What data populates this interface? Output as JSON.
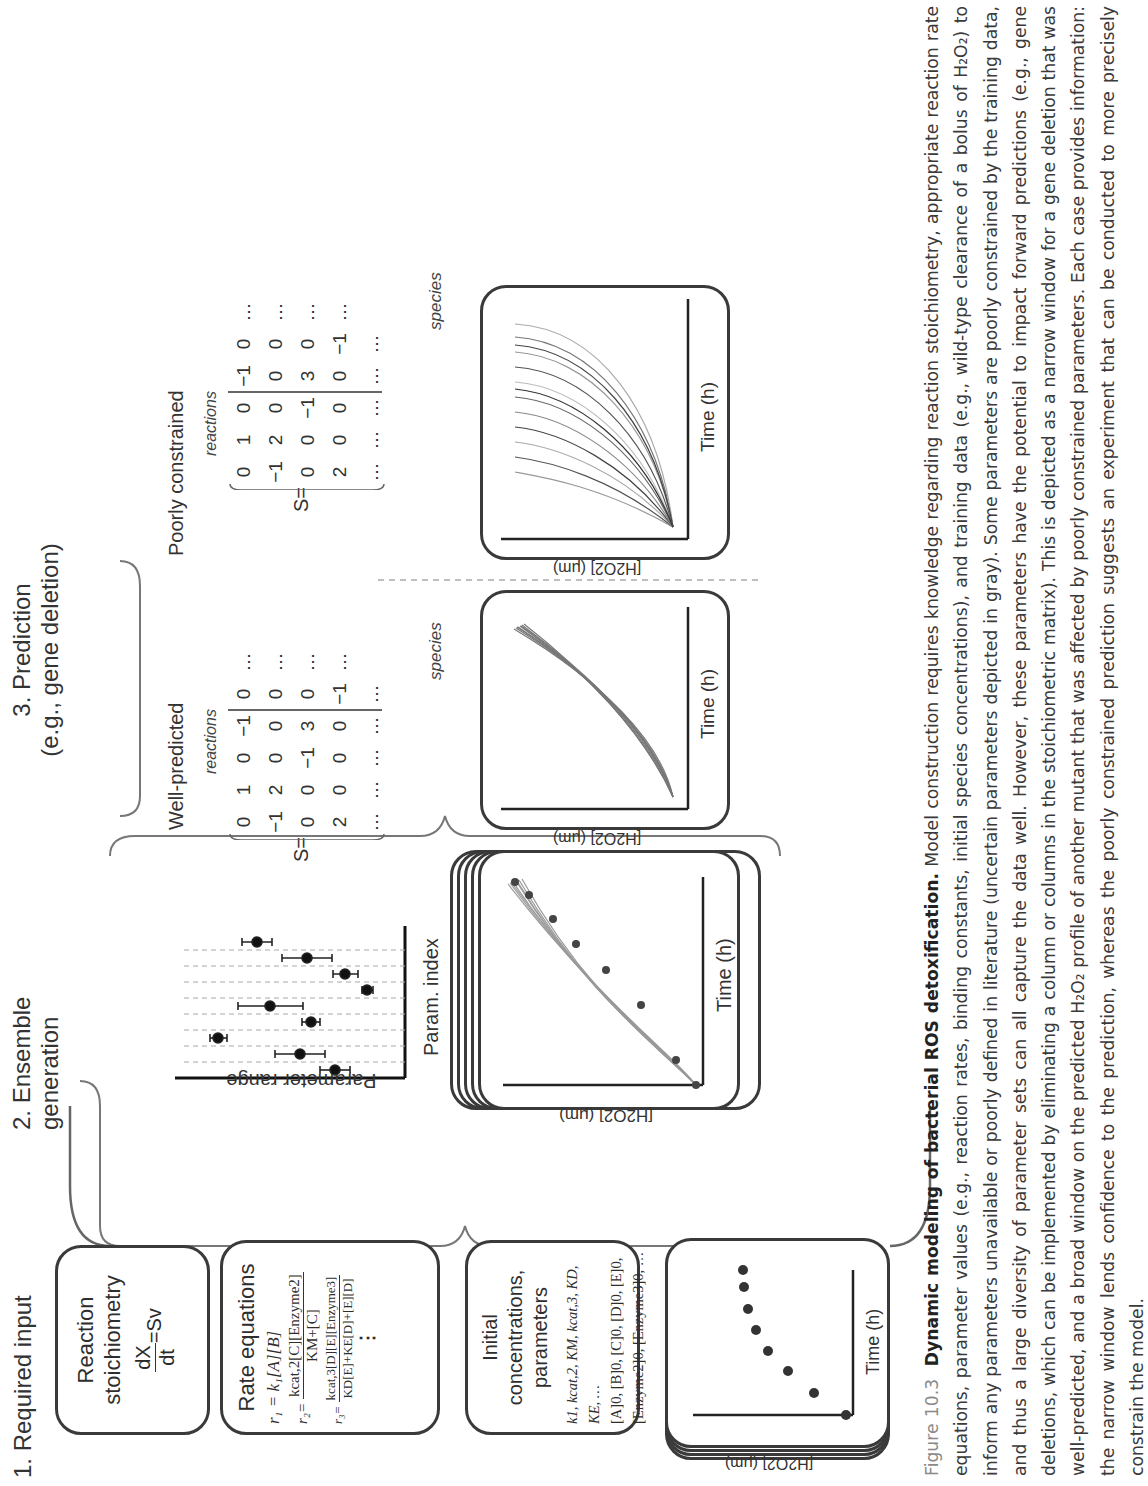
{
  "figure": {
    "sections": {
      "input": {
        "title": "1. Required input"
      },
      "ensemble": {
        "title_line1": "2. Ensemble",
        "title_line2": "generation"
      },
      "prediction": {
        "title_line1": "3. Prediction",
        "title_line2": "(e.g., gene deletion)"
      }
    },
    "input_boxes": {
      "stoichiometry": {
        "title_line1": "Reaction",
        "title_line2": "stoichiometry",
        "eq_num": "dX",
        "eq_den": "dt",
        "eq_rhs": "=Sv"
      },
      "rate_equations": {
        "title": "Rate equations",
        "r1": "r₁ = k₁[A][B]",
        "r2_lhs": "r₂=",
        "r2_num": "kₒₐₜ,₂[C][Enzyme₂]",
        "r2_num_display": "kcat,2[C][Enzyme2]",
        "r2_den_display": "KM+[C]",
        "r3_lhs": "r₃=",
        "r3_num_display": "kcat,3[D][E][Enzyme3]",
        "r3_den_display": "KD[E]+KE[D]+[E][D]",
        "ellipsis": "⋮"
      },
      "initial_conc": {
        "title_line1": "Initial concentrations,",
        "title_line2": "parameters",
        "line1": "k1, kcat,2, KM, kcat,3, KD, KE, …",
        "line2": "[A]0, [B]0, [C]0, [D]0, [E]0,",
        "line3": "[Enzyme2]0, [Enzyme3]0, …"
      },
      "training_data": {
        "xlabel": "Time (h)",
        "ylabel": "[H2O2] (μm)"
      }
    },
    "param_plot": {
      "xlabel": "Param. index",
      "ylabel": "Parameter range"
    },
    "ensemble_plot": {
      "xlabel": "Time (h)",
      "ylabel": "[H2O2] (μm)"
    },
    "well_predicted": {
      "label": "Well-predicted",
      "matrix_prefix": "S=",
      "reactions_label": "reactions",
      "species_label": "species",
      "matrix": [
        [
          "0",
          "1",
          "0",
          "−1",
          "0",
          "…"
        ],
        [
          "−1",
          "2",
          "0",
          "0",
          "0",
          "…"
        ],
        [
          "0",
          "0",
          "−1",
          "3",
          "0",
          "…"
        ],
        [
          "2",
          "0",
          "0",
          "0",
          "−1",
          "…"
        ],
        [
          "…",
          "…",
          "…",
          "…",
          "…",
          ""
        ]
      ],
      "struck_column": 3,
      "xlabel": "Time (h)",
      "ylabel": "[H2O2] (μm)"
    },
    "poorly_constrained": {
      "label": "Poorly constrained",
      "matrix_prefix": "S=",
      "reactions_label": "reactions",
      "species_label": "species",
      "matrix": [
        [
          "0",
          "1",
          "0",
          "−1",
          "0",
          "…"
        ],
        [
          "−1",
          "2",
          "0",
          "0",
          "0",
          "…"
        ],
        [
          "0",
          "0",
          "−1",
          "3",
          "0",
          "…"
        ],
        [
          "2",
          "0",
          "0",
          "0",
          "−1",
          "…"
        ],
        [
          "…",
          "…",
          "…",
          "…",
          "…",
          ""
        ]
      ],
      "struck_column": 2,
      "xlabel": "Time (h)",
      "ylabel": "[H2O2] (μm)"
    }
  },
  "caption": {
    "figure_number": "Figure 10.3",
    "title": "Dynamic modeling of bacterial ROS detoxification.",
    "body": "Model construction requires knowledge regarding reaction stoichiometry, appropriate reaction rate equations, parameter values (e.g., reaction rates, binding constants, initial species concentrations), and training data (e.g., wild-type clearance of a bolus of H₂O₂) to inform any parameters unavailable or poorly defined in literature (uncertain parameters depicted in gray). Some parameters are poorly constrained by the training data, and thus a large diversity of parameter sets can all capture the data well. However, these parameters have the potential to impact forward predictions (e.g., gene deletions, which can be implemented by eliminating a column or columns in the stoichiometric matrix). This is depicted as a narrow window for a gene deletion that was well-predicted, and a broad window on the predicted H₂O₂ profile of another mutant that was affected by poorly constrained parameters. Each case provides information: the narrow window lends confidence to the prediction, whereas the poorly constrained prediction suggests an experiment that can be conducted to more precisely constrain the model."
  },
  "chart_data": [
    {
      "type": "scatter",
      "title": "Training data",
      "xlabel": "Time (h)",
      "ylabel": "[H2O2] (μm)",
      "x": [
        0,
        1,
        2,
        3,
        4,
        5,
        6,
        7
      ],
      "y": [
        0,
        0.16,
        0.33,
        0.47,
        0.62,
        0.78,
        0.95,
        1.0
      ],
      "grid": false
    },
    {
      "type": "scatter",
      "title": "Parameter ensemble ranges",
      "xlabel": "Param. index",
      "ylabel": "Parameter range",
      "categories": [
        1,
        2,
        3,
        4,
        5,
        6,
        7,
        8,
        9
      ],
      "values": [
        0.24,
        0.47,
        0.82,
        0.37,
        0.62,
        0.12,
        0.22,
        0.46,
        0.8
      ],
      "error_low": [
        0.07,
        0.13,
        0.04,
        0.04,
        0.16,
        0.03,
        0.06,
        0.12,
        0.07
      ],
      "error_high": [
        0.07,
        0.13,
        0.04,
        0.04,
        0.16,
        0.03,
        0.06,
        0.12,
        0.07
      ],
      "grid": "dashed horizontal"
    },
    {
      "type": "line",
      "title": "Ensemble fits to training data",
      "xlabel": "Time (h)",
      "ylabel": "[H2O2] (μm)",
      "note": "~12 gray simulated trajectories tightly overlaying 8 black data points"
    },
    {
      "type": "line",
      "title": "Well-predicted",
      "xlabel": "Time (h)",
      "ylabel": "[H2O2] (μm)",
      "note": "~12 trajectories with narrow spread"
    },
    {
      "type": "line",
      "title": "Poorly constrained",
      "xlabel": "Time (h)",
      "ylabel": "[H2O2] (μm)",
      "note": "~16 trajectories with broad spread"
    }
  ]
}
